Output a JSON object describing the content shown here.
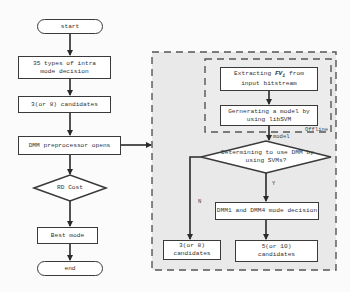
{
  "diagram": {
    "main_flow": {
      "start": "start",
      "intra_mode": "35 types of intra mode decision",
      "candidates": "3(or 8) candidates",
      "dmm_pre": "DMM preprocessor opens",
      "rd_cost": "RD Cost",
      "best_mode": "Best mode",
      "end": "end"
    },
    "dmm_module": {
      "extract_prefix": "Extracting ",
      "extract_symbol": "FV",
      "extract_subscript": "i",
      "extract_suffix": " from",
      "extract_line2": "input bitstream",
      "generate_line1": "Gernerating a model by",
      "generate_line2": "using libSVM",
      "offline_label": "Offline",
      "model_label": "model",
      "decision_line1": "Determining to use DMM by",
      "decision_line2": "using SVMs?",
      "yes_label": "Y",
      "no_label": "N",
      "dmm_decision": "DMM1 and DMM4 mode decision",
      "left_result_line1": "3(or 8)",
      "left_result_line2": "candidates",
      "right_result_line1": "5(or 10)",
      "right_result_line2": "candidates"
    },
    "colors": {
      "stroke": "#3a3a3a",
      "dashed_region_fill": "#e9e9e9",
      "box_fill": "#ffffff"
    }
  }
}
